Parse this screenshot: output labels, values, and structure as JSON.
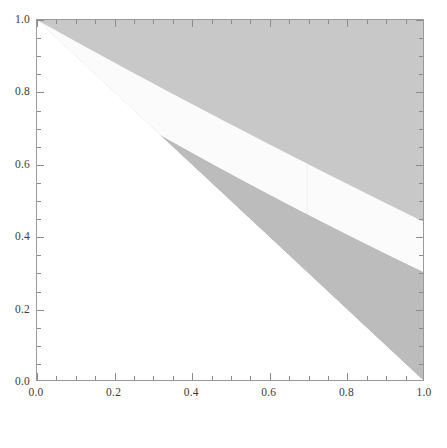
{
  "figure": {
    "kind": "contour-plot",
    "width": 447,
    "height": 448,
    "background": "#ffffff",
    "frame_color": "#9a9a9a",
    "tick_color": "#8c8c8c",
    "label_color": "#3d3d3d"
  },
  "chart_data": {
    "type": "heatmap",
    "subtype": "filled-contour",
    "title": "",
    "subtitle": "",
    "xlabel": "",
    "ylabel": "",
    "xlim": [
      0.0,
      1.0
    ],
    "ylim": [
      0.0,
      1.0
    ],
    "grid": false,
    "legend": "none",
    "colormap": "grayscale",
    "x_ticks": [
      {
        "value": 0.0,
        "label": "0.0",
        "type": "major"
      },
      {
        "value": 0.1,
        "label": "",
        "type": "minor"
      },
      {
        "value": 0.2,
        "label": "0.2",
        "type": "major"
      },
      {
        "value": 0.3,
        "label": "",
        "type": "minor"
      },
      {
        "value": 0.4,
        "label": "0.4",
        "type": "major"
      },
      {
        "value": 0.5,
        "label": "",
        "type": "minor"
      },
      {
        "value": 0.6,
        "label": "0.6",
        "type": "major"
      },
      {
        "value": 0.7,
        "label": "",
        "type": "minor"
      },
      {
        "value": 0.8,
        "label": "0.8",
        "type": "major"
      },
      {
        "value": 0.9,
        "label": "",
        "type": "minor"
      },
      {
        "value": 1.0,
        "label": "1.0",
        "type": "major"
      }
    ],
    "x_minor_ticks": [
      0.05,
      0.15,
      0.25,
      0.35,
      0.45,
      0.55,
      0.65,
      0.75,
      0.85,
      0.95
    ],
    "y_ticks": [
      {
        "value": 0.0,
        "label": "0.0",
        "type": "major"
      },
      {
        "value": 0.1,
        "label": "",
        "type": "minor"
      },
      {
        "value": 0.2,
        "label": "0.2",
        "type": "major"
      },
      {
        "value": 0.3,
        "label": "",
        "type": "minor"
      },
      {
        "value": 0.4,
        "label": "0.4",
        "type": "major"
      },
      {
        "value": 0.5,
        "label": "",
        "type": "minor"
      },
      {
        "value": 0.6,
        "label": "0.6",
        "type": "major"
      },
      {
        "value": 0.7,
        "label": "",
        "type": "minor"
      },
      {
        "value": 0.8,
        "label": "0.8",
        "type": "major"
      },
      {
        "value": 0.9,
        "label": "",
        "type": "minor"
      },
      {
        "value": 1.0,
        "label": "1.0",
        "type": "major"
      }
    ],
    "y_minor_ticks": [
      0.05,
      0.15,
      0.25,
      0.35,
      0.45,
      0.55,
      0.65,
      0.75,
      0.85,
      0.95
    ],
    "regions": [
      {
        "name": "undefined-lower-triangle",
        "description": "Blank white triangle below the line x + y = 1; function not defined / value zero.",
        "color": "#ffffff",
        "boundary": "x + y = 1"
      },
      {
        "name": "gray-band-outer-lower",
        "description": "Medium gray band occupying the lower-right part of the upper triangle, bounded below by x + y = 1 and above by the white arc.",
        "color": "#bcbcbc"
      },
      {
        "name": "white-arc-band",
        "description": "Near-white curved band sweeping from the upper-left of the triangle down to the right edge.",
        "color": "#fbfbfb"
      },
      {
        "name": "gray-band-inner-upper",
        "description": "Medium gray band between the white arc and the upper-left dark region.",
        "color": "#bcbcbc"
      },
      {
        "name": "gray-band-top",
        "description": "Slightly lighter gray region filling the top-right corner area above the inner band.",
        "color": "#c8c8c8"
      }
    ],
    "contour_levels": [
      0.0,
      0.25,
      0.5,
      0.75,
      1.0
    ],
    "level_colors": [
      "#ffffff",
      "#bcbcbc",
      "#fbfbfb",
      "#bcbcbc",
      "#c8c8c8"
    ]
  }
}
